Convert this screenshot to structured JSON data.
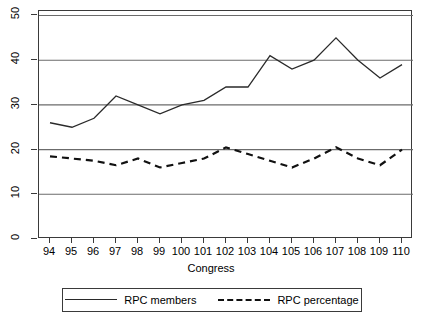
{
  "chart_data": {
    "type": "line",
    "title": "",
    "xlabel": "Congress",
    "ylabel": "",
    "x": [
      94,
      95,
      96,
      97,
      98,
      99,
      100,
      101,
      102,
      103,
      104,
      105,
      106,
      107,
      108,
      109,
      110
    ],
    "xticklabels": [
      "94",
      "95",
      "96",
      "97",
      "98",
      "99",
      "100",
      "101",
      "102",
      "103",
      "104",
      "105",
      "106",
      "107",
      "108",
      "109",
      "110"
    ],
    "yticklabels": [
      "0",
      "10",
      "20",
      "30",
      "40",
      "50"
    ],
    "yticks": [
      0,
      10,
      20,
      30,
      40,
      50
    ],
    "ylim": [
      0,
      51
    ],
    "xlim": [
      93.5,
      110.5
    ],
    "grid": "horizontal",
    "legend_position": "below-axes",
    "series": [
      {
        "name": "RPC members",
        "style": "solid",
        "color": "#2a2a2a",
        "values": [
          26,
          25,
          27,
          32,
          30,
          28,
          30,
          31,
          34,
          34,
          41,
          38,
          40,
          45,
          40,
          36,
          39
        ]
      },
      {
        "name": "RPC percentage",
        "style": "dashed",
        "color": "#111111",
        "values": [
          18.5,
          18,
          17.5,
          16.5,
          18,
          16,
          17,
          18,
          20.5,
          19,
          17.5,
          16,
          18,
          20.5,
          18,
          16.5,
          20
        ]
      }
    ]
  },
  "axis": {
    "x_title": "Congress",
    "y_labels": [
      "50",
      "40",
      "30",
      "20",
      "10",
      "0"
    ],
    "x_labels": [
      "94",
      "95",
      "96",
      "97",
      "98",
      "99",
      "100",
      "101",
      "102",
      "103",
      "104",
      "105",
      "106",
      "107",
      "108",
      "109",
      "110"
    ]
  },
  "legend": {
    "items": [
      {
        "label": "RPC members",
        "style": "solid"
      },
      {
        "label": "RPC percentage",
        "style": "dashed"
      }
    ]
  },
  "colors": {
    "frame": "#3a3a3a",
    "grid": "#6b6b6b",
    "series_solid": "#2a2a2a",
    "series_dashed": "#111111",
    "background": "#ffffff"
  }
}
